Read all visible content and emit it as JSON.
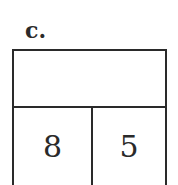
{
  "problem_label": "c.",
  "number_bond": {
    "whole": "",
    "parts": [
      "8",
      "5"
    ]
  }
}
